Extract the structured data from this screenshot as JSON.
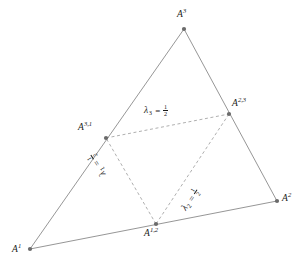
{
  "figure": {
    "width": 305,
    "height": 270,
    "background": "#ffffff",
    "stroke_solid": "#8a8a8a",
    "stroke_dashed": "#9a9a9a",
    "vertex_dot_color": "#6b6b6b",
    "text_color": "#1a1a1a"
  },
  "points": {
    "A1": {
      "label_base": "A",
      "label_sup": "1",
      "x": 30,
      "y": 249
    },
    "A2": {
      "label_base": "A",
      "label_sup": "2",
      "x": 277,
      "y": 201
    },
    "A3": {
      "label_base": "A",
      "label_sup": "3",
      "x": 184,
      "y": 29
    },
    "A12": {
      "label_base": "A",
      "label_sup": "1,2",
      "x": 156,
      "y": 224
    },
    "A23": {
      "label_base": "A",
      "label_sup": "2,3",
      "x": 229,
      "y": 114
    },
    "A31": {
      "label_base": "A",
      "label_sup": "3,1",
      "x": 106,
      "y": 138
    }
  },
  "labels": {
    "A1_text": "A",
    "A1_sup": "1",
    "A2_text": "A",
    "A2_sup": "2",
    "A3_text": "A",
    "A3_sup": "3",
    "A12_text": "A",
    "A12_sup": "1,2",
    "A23_text": "A",
    "A23_sup": "2,3",
    "A31_text": "A",
    "A31_sup": "3,1"
  },
  "lambdas": [
    {
      "id": "lambda1",
      "symbol": "λ",
      "subscript": "1",
      "equals": "=",
      "numerator": "1",
      "denominator": "2",
      "edge": "A31-A12",
      "rotation_deg": -122
    },
    {
      "id": "lambda2",
      "symbol": "λ",
      "subscript": "2",
      "equals": "=",
      "numerator": "1",
      "denominator": "2",
      "edge": "A12-A23",
      "rotation_deg": -56
    },
    {
      "id": "lambda3",
      "symbol": "λ",
      "subscript": "3",
      "equals": "=",
      "numerator": "1",
      "denominator": "2",
      "edge": "A23-A31",
      "rotation_deg": 0
    }
  ],
  "edges": {
    "outer": [
      {
        "name": "edge-A1-A2",
        "from": "A1",
        "to": "A2",
        "style": "solid"
      },
      {
        "name": "edge-A2-A3",
        "from": "A2",
        "to": "A3",
        "style": "solid"
      },
      {
        "name": "edge-A3-A1",
        "from": "A3",
        "to": "A1",
        "style": "solid"
      }
    ],
    "inner": [
      {
        "name": "edge-A31-A23",
        "from": "A31",
        "to": "A23",
        "style": "dashed"
      },
      {
        "name": "edge-A23-A12",
        "from": "A23",
        "to": "A12",
        "style": "dashed"
      },
      {
        "name": "edge-A12-A31",
        "from": "A12",
        "to": "A31",
        "style": "dashed"
      }
    ]
  }
}
